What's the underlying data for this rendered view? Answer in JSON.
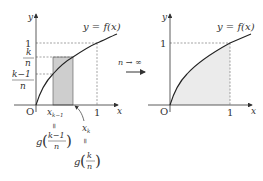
{
  "left_graph": {
    "y_axis_label": "y",
    "x_axis_label": "x",
    "origin_label": "O",
    "curve_label": "y = f(x)",
    "y_tick_one": "1",
    "y_tick_k_num": "k",
    "y_tick_k_den": "n",
    "y_tick_km1_num": "k−1",
    "y_tick_km1_den": "n",
    "x_tick_one": "1",
    "x_km1_label": "x",
    "x_km1_sub": "k−1",
    "x_k_label": "x",
    "x_k_sub": "k",
    "eq_symbol": "=",
    "g_km1_func": "g",
    "g_km1_num": "k−1",
    "g_km1_den": "n",
    "g_k_func": "g",
    "g_k_num": "k",
    "g_k_den": "n"
  },
  "transition": {
    "label": "n → ∞"
  },
  "right_graph": {
    "y_axis_label": "y",
    "x_axis_label": "x",
    "origin_label": "O",
    "curve_label": "y = f(x)",
    "y_tick_one": "1",
    "x_tick_one": "1"
  },
  "colors": {
    "axis": "#333333",
    "curve": "#222222",
    "rect_fill": "#d6d6d6",
    "area_fill": "#ececec",
    "dashed": "#555555"
  }
}
